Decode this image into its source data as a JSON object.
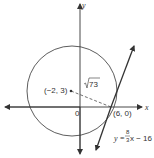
{
  "diagram": {
    "axes": {
      "x_label": "x",
      "y_label": "y",
      "origin_label": "0"
    },
    "circle": {
      "center_label": "(−2, 3)",
      "radius_label": "√73",
      "radius_radicand": "73"
    },
    "tangent_point_label": "(6, 0)",
    "tangent_line": {
      "equation_lhs": "y = ",
      "slope_numerator": "8",
      "slope_denominator": "3",
      "equation_rhs": "x − 16"
    },
    "colors": {
      "stroke": "#333333",
      "background": "#ffffff"
    }
  }
}
